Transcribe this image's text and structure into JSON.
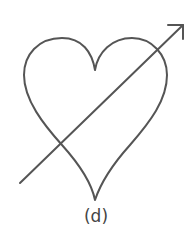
{
  "figure": {
    "label": "(d)",
    "stroke_color": "#555555",
    "shapes": [
      "heart-outline",
      "arrow"
    ]
  }
}
